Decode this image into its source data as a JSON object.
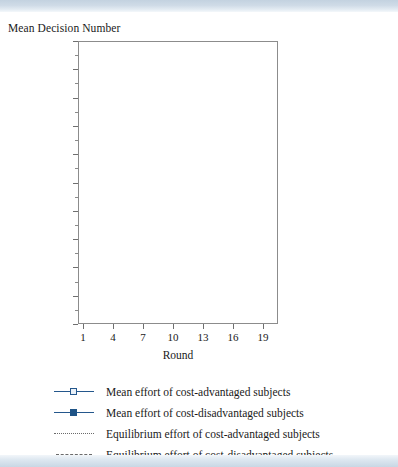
{
  "figure": {
    "ylabel_top": "Mean Decision Number",
    "xaxis_title": "Round"
  },
  "legend": {
    "items": [
      {
        "key": "line-open-square",
        "label": "Mean effort of cost-advantaged subjects"
      },
      {
        "key": "line-filled-square",
        "label": "Mean effort of cost-disadvantaged subjects"
      },
      {
        "key": "dotted-line",
        "label": "Equilibrium effort of cost-advantaged subjects"
      },
      {
        "key": "dashed-line",
        "label": "Equilibrium effort of cost-disadvantaged subjects"
      }
    ]
  },
  "colors": {
    "series_blue": "#24578c",
    "marker_fill_open": "#eaf1f8",
    "reference_gray": "#6b6b6b",
    "frame_gray": "#8c8c8c",
    "band_blue": "#c3d2e0"
  },
  "chart_data": {
    "type": "line",
    "title": "",
    "xlabel": "Round",
    "ylabel": "Mean Decision Number",
    "xlim": [
      0.5,
      20.5
    ],
    "ylim": [
      0,
      100
    ],
    "yticks": [
      0,
      10,
      20,
      30,
      40,
      50,
      60,
      70,
      80,
      90,
      100
    ],
    "xticks": [
      1,
      4,
      7,
      10,
      13,
      16,
      19
    ],
    "grid": false,
    "legend_position": "below",
    "x": [
      1,
      2,
      3,
      4,
      5,
      6,
      7,
      8,
      9,
      10,
      11,
      12,
      13,
      14,
      15,
      16,
      17,
      18,
      19,
      20
    ],
    "series": [
      {
        "name": "Mean effort of cost-advantaged subjects",
        "marker": "open-square",
        "color": "#24578c",
        "values": [
          58,
          68,
          65,
          73,
          75,
          84,
          68,
          76,
          84,
          72,
          83,
          83,
          84,
          87,
          86,
          85,
          76,
          78,
          83,
          88
        ]
      },
      {
        "name": "Mean effort of cost-disadvantaged subjects",
        "marker": "filled-square",
        "color": "#1f5487",
        "values": [
          30,
          36,
          29.5,
          12.5,
          20.5,
          15.5,
          27,
          22,
          11.5,
          8.5,
          21,
          7.5,
          2,
          11,
          1.5,
          1.5,
          9,
          13,
          5.5,
          2
        ]
      }
    ],
    "reference_lines": [
      {
        "name": "Equilibrium effort of cost-advantaged subjects",
        "value": 76,
        "style": "dotted",
        "color": "#6b6b6b"
      },
      {
        "name": "Equilibrium effort of cost-disadvantaged subjects",
        "value": 19,
        "style": "dashed",
        "color": "#6b6b6b"
      }
    ]
  }
}
